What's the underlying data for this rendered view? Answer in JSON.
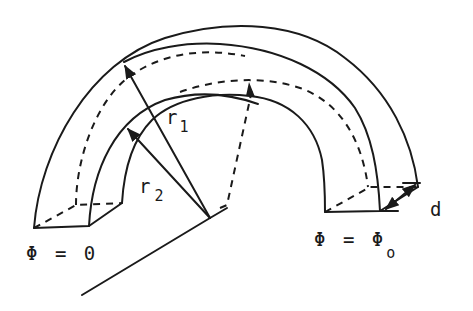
{
  "diagram": {
    "stroke_color": "#1a1a1a",
    "background": "#ffffff",
    "labels": {
      "r1": {
        "base": "r",
        "sub": "1"
      },
      "r2": {
        "base": "r",
        "sub": "2"
      },
      "phi_start": {
        "text": "Φ = 0"
      },
      "phi_end": {
        "base": "Φ = Φ",
        "sub": "o"
      },
      "depth": {
        "text": "d"
      }
    },
    "elements": [
      "outer-arc (radius r1)",
      "inner-arc (radius r2)",
      "back-outer-arc (hidden, dashed)",
      "back-inner-arc (hidden, dashed)",
      "left end face at Φ = 0",
      "right end face at Φ = Φo",
      "radius arrow r1",
      "radius arrow r2",
      "dashed radius arrow (back plane)",
      "baseline axis",
      "depth dimension arrow d"
    ]
  }
}
